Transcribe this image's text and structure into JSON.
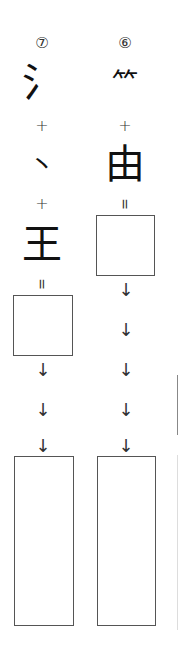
{
  "columns": [
    {
      "number": "⑦",
      "parts": [
        "氵",
        "丶",
        "王"
      ],
      "plus": "+",
      "equals": "=",
      "arrow": "↓",
      "answer_box_small": "",
      "answer_box_tall": ""
    },
    {
      "number": "⑥",
      "parts": [
        "⺮",
        "由"
      ],
      "plus": "+",
      "equals": "=",
      "arrow": "↓",
      "answer_box_small": "",
      "answer_box_tall": ""
    }
  ],
  "colors": {
    "stroke": "#555555",
    "text": "#222222"
  }
}
